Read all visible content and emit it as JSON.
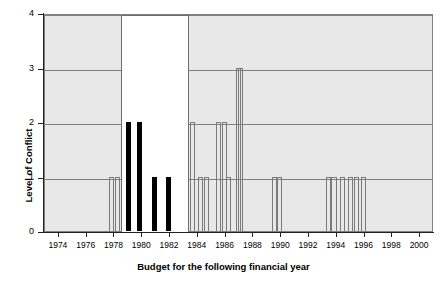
{
  "chart_data": {
    "type": "bar",
    "title": "",
    "xlabel": "Budget for the following financial year",
    "ylabel": "Level of Conflict",
    "xlim": [
      1973,
      2001
    ],
    "ylim": [
      0,
      4
    ],
    "xticks": [
      1974,
      1976,
      1978,
      1980,
      1982,
      1984,
      1986,
      1988,
      1990,
      1992,
      1994,
      1996,
      1998,
      2000
    ],
    "yticks": [
      0,
      1,
      2,
      3,
      4
    ],
    "grid": true,
    "legend": "none",
    "bar_style_note": "Solid black bars mark the highlighted 1979-1982 period; all other bars are thin hollow outlines.",
    "highlight_region": {
      "x_start": 1978.5,
      "x_end": 1983.4,
      "y_top": 4
    },
    "x": [
      1977.8,
      1978.2,
      1979.0,
      1979.8,
      1980.9,
      1981.9,
      1983.6,
      1984.2,
      1984.6,
      1985.5,
      1985.9,
      1986.2,
      1986.9,
      1987.1,
      1989.5,
      1989.9,
      1993.4,
      1993.8,
      1994.4,
      1995.0,
      1995.4,
      1995.9
    ],
    "values": [
      1,
      1,
      2,
      2,
      1,
      1,
      2,
      1,
      1,
      2,
      2,
      1,
      3,
      3,
      1,
      1,
      1,
      1,
      1,
      1,
      1,
      1
    ],
    "filled": [
      false,
      false,
      true,
      true,
      true,
      true,
      false,
      false,
      false,
      false,
      false,
      false,
      false,
      false,
      false,
      false,
      false,
      false,
      false,
      false,
      false,
      false
    ]
  },
  "axis": {
    "y_tick_labels": [
      "0",
      "1",
      "2",
      "3",
      "4"
    ],
    "x_tick_labels": [
      "1974",
      "1976",
      "1978",
      "1980",
      "1982",
      "1984",
      "1986",
      "1988",
      "1990",
      "1992",
      "1994",
      "1996",
      "1998",
      "2000"
    ],
    "y_title": "Level of Conflict",
    "x_title": "Budget for the following financial year"
  },
  "colors": {
    "plot_background": "#e8e8e8",
    "gridline": "#808080",
    "bar_filled": "#000000",
    "bar_hollow_border": "#7a7a7a",
    "highlight_fill": "#ffffff",
    "highlight_border": "#6e6e6e",
    "axis": "#222222",
    "text": "#000000"
  }
}
